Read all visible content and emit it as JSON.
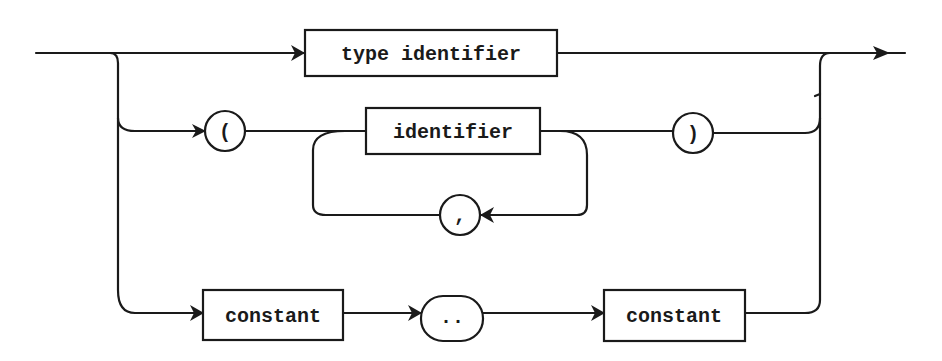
{
  "diagram": {
    "type": "syntax-diagram",
    "nodes": {
      "type_identifier": "type identifier",
      "open_paren": "(",
      "identifier": "identifier",
      "close_paren": ")",
      "comma": ",",
      "constant_low": "constant",
      "range_dots": "..",
      "constant_high": "constant"
    },
    "colors": {
      "line": "#1a1a1a",
      "background": "#ffffff"
    }
  }
}
